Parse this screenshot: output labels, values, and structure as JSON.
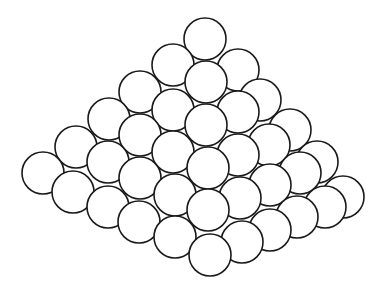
{
  "figure": {
    "background": "#ffffff",
    "stroke_color": "#1a1a1a",
    "fill_color": "#ffffff",
    "radius": 21,
    "spheres": [
      [
        43,
        173
      ],
      [
        76,
        147
      ],
      [
        109,
        119
      ],
      [
        140,
        92
      ],
      [
        173,
        65
      ],
      [
        205,
        39
      ],
      [
        73,
        192
      ],
      [
        108,
        162
      ],
      [
        140,
        135
      ],
      [
        173,
        110
      ],
      [
        206,
        82
      ],
      [
        238,
        70
      ],
      [
        108,
        207
      ],
      [
        140,
        178
      ],
      [
        173,
        152
      ],
      [
        206,
        125
      ],
      [
        238,
        112
      ],
      [
        260,
        100
      ],
      [
        139,
        222
      ],
      [
        175,
        195
      ],
      [
        208,
        168
      ],
      [
        238,
        155
      ],
      [
        269,
        145
      ],
      [
        290,
        130
      ],
      [
        175,
        237
      ],
      [
        208,
        210
      ],
      [
        240,
        198
      ],
      [
        270,
        185
      ],
      [
        300,
        173
      ],
      [
        317,
        162
      ],
      [
        210,
        255
      ],
      [
        242,
        242
      ],
      [
        270,
        230
      ],
      [
        297,
        217
      ],
      [
        325,
        207
      ],
      [
        343,
        197
      ]
    ]
  }
}
